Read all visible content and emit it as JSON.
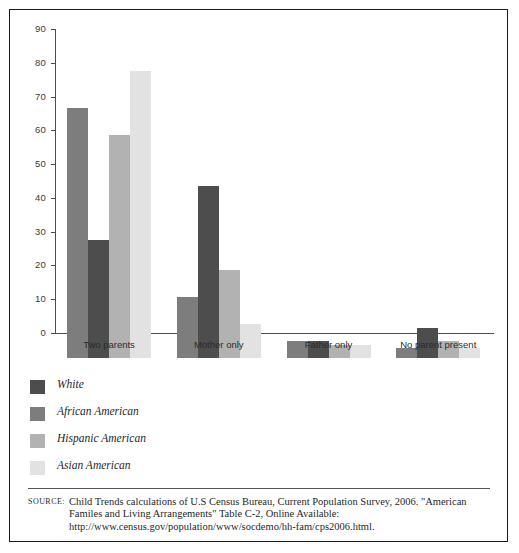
{
  "chart_data": {
    "type": "bar",
    "title": "",
    "subtitle": "",
    "xlabel": "",
    "ylabel": "",
    "ylim": [
      0,
      90
    ],
    "yticks": [
      0,
      10,
      20,
      30,
      40,
      50,
      60,
      70,
      80,
      90
    ],
    "ytick_labels": [
      "0",
      "10",
      "20",
      "30",
      "40",
      "50",
      "60",
      "70",
      "80",
      "90"
    ],
    "grid": false,
    "legend_position": "below-plot-left",
    "grouped": true,
    "bar_draw_order": [
      "African American",
      "White",
      "Hispanic American",
      "Asian American"
    ],
    "categories": [
      "Two parents",
      "Mother only",
      "Father only",
      "No parent present"
    ],
    "series": [
      {
        "name": "White",
        "color": "#4d4d4d",
        "values": [
          35,
          51,
          5,
          9
        ]
      },
      {
        "name": "African American",
        "color": "#7d7d7d",
        "values": [
          74,
          18,
          5,
          3
        ]
      },
      {
        "name": "Hispanic American",
        "color": "#b2b2b2",
        "values": [
          66,
          26,
          4,
          5
        ]
      },
      {
        "name": "Asian American",
        "color": "#e2e2e2",
        "values": [
          85,
          10,
          4,
          3
        ]
      }
    ]
  },
  "legend": {
    "items": [
      {
        "label": "White",
        "color": "#4d4d4d"
      },
      {
        "label": "African American",
        "color": "#7d7d7d"
      },
      {
        "label": "Hispanic American",
        "color": "#b2b2b2"
      },
      {
        "label": "Asian American",
        "color": "#e2e2e2"
      }
    ]
  },
  "source": {
    "label": "Source:",
    "lines": [
      "Child Trends calculations of U.S Census Bureau, Current Population Survey, 2006. \"American",
      "Familes and Living Arrangements\" Table C-2, Online Available:",
      "http://www.census.gov/population/www/socdemo/hh-fam/cps2006.html."
    ]
  },
  "colors": {
    "frame": "#1a1a1a",
    "axis": "#4d4d4d",
    "background": "#ffffff",
    "text": "#1f1f1f"
  }
}
